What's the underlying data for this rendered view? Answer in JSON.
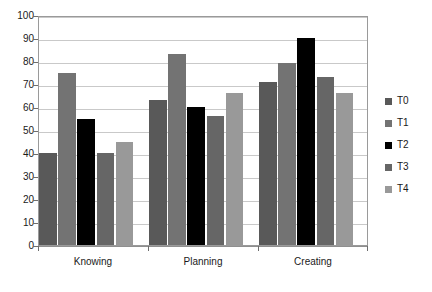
{
  "chart_data": {
    "type": "bar",
    "title": "",
    "subtitle": "",
    "xlabel": "",
    "ylabel": "",
    "categories": [
      "Knowing",
      "Planning",
      "Creating"
    ],
    "series": [
      {
        "name": "T0",
        "color": "#595959",
        "values": [
          40,
          63,
          71
        ]
      },
      {
        "name": "T1",
        "color": "#737373",
        "values": [
          75,
          83,
          79
        ]
      },
      {
        "name": "T2",
        "color": "#000000",
        "values": [
          55,
          60,
          90
        ]
      },
      {
        "name": "T3",
        "color": "#666666",
        "values": [
          40,
          56,
          73
        ]
      },
      {
        "name": "T4",
        "color": "#999999",
        "values": [
          45,
          66,
          66
        ]
      }
    ],
    "ylim": [
      0,
      100
    ],
    "ytick_step": 10,
    "yticks": [
      0,
      10,
      20,
      30,
      40,
      50,
      60,
      70,
      80,
      90,
      100
    ],
    "ytick_labels": [
      "0",
      "10",
      "20",
      "30",
      "40",
      "50",
      "60",
      "70",
      "80",
      "90",
      "100"
    ],
    "grid": true,
    "grid_axis": "y",
    "legend": true,
    "legend_position": "right",
    "legend_entries": [
      "T0",
      "T1",
      "T2",
      "T3",
      "T4"
    ],
    "plot_background": "#ffffff",
    "grid_color": "#c9c9c9",
    "axis_color": "#9a9a9a",
    "text_color": "#1a1a1a"
  }
}
